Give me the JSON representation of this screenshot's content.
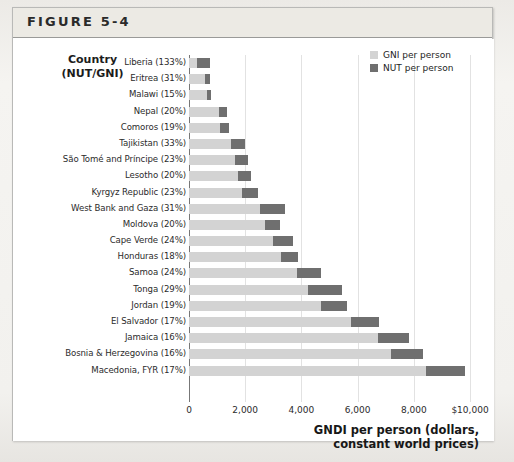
{
  "figure": {
    "title": "FIGURE 5-4"
  },
  "axis_header": {
    "line1": "Country",
    "line2": "(NUT/GNI)"
  },
  "legend": {
    "items": [
      {
        "label": "GNI per person",
        "color": "#d3d3d3",
        "key": "gni"
      },
      {
        "label": "NUT per person",
        "color": "#6f6f6f",
        "key": "nut"
      }
    ]
  },
  "xaxis": {
    "title_line1": "GNDI per person (dollars,",
    "title_line2": "constant world prices)",
    "ticks": [
      "0",
      "2,000",
      "4,000",
      "6,000",
      "8,000",
      "$10,000"
    ],
    "tick_values": [
      0,
      2000,
      4000,
      6000,
      8000,
      10000
    ]
  },
  "chart_data": {
    "type": "bar",
    "orientation": "horizontal",
    "stacked": true,
    "title": "FIGURE 5-4",
    "xlabel": "GNDI per person (dollars, constant world prices)",
    "ylabel": "Country (NUT/GNI)",
    "xlim": [
      0,
      10000
    ],
    "xticks": [
      0,
      2000,
      4000,
      6000,
      8000,
      10000
    ],
    "xticklabels": [
      "0",
      "2,000",
      "4,000",
      "6,000",
      "8,000",
      "$10,000"
    ],
    "grid": "vertical",
    "legend_position": "top-right",
    "categories": [
      "Liberia (133%)",
      "Eritrea (31%)",
      "Malawi (15%)",
      "Nepal (20%)",
      "Comoros (19%)",
      "Tajikistan (33%)",
      "São Tomé and Príncipe (23%)",
      "Lesotho (20%)",
      "Kyrgyz Republic (23%)",
      "West Bank and Gaza (31%)",
      "Moldova (20%)",
      "Cape Verde (24%)",
      "Honduras (18%)",
      "Samoa (24%)",
      "Tonga (29%)",
      "Jordan (19%)",
      "El Salvador (17%)",
      "Jamaica (16%)",
      "Bosnia & Herzegovina (16%)",
      "Macedonia, FYR (17%)"
    ],
    "series": [
      {
        "name": "GNI per person",
        "color": "#d3d3d3",
        "values": [
          290,
          560,
          640,
          1060,
          1110,
          1500,
          1650,
          1730,
          1870,
          2540,
          2720,
          2990,
          3280,
          3830,
          4240,
          4700,
          5780,
          6730,
          7190,
          8430
        ]
      },
      {
        "name": "NUT per person",
        "color": "#6f6f6f",
        "values": [
          470,
          180,
          140,
          310,
          300,
          500,
          440,
          490,
          580,
          880,
          530,
          700,
          600,
          870,
          1200,
          930,
          990,
          1110,
          1140,
          1380
        ]
      }
    ],
    "totals": [
      760,
      740,
      780,
      1370,
      1410,
      2000,
      2090,
      2220,
      2450,
      3420,
      3250,
      3690,
      3880,
      4700,
      5440,
      5630,
      6770,
      7840,
      8330,
      9810
    ]
  }
}
